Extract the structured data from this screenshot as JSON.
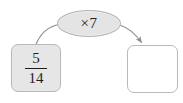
{
  "diagram": {
    "type": "function-machine",
    "operator": {
      "label": "×7",
      "operation": "multiply",
      "factor": "7"
    },
    "input_node": {
      "value": "5/14",
      "numerator": "5",
      "denominator": "14"
    },
    "output_node": {
      "value": "",
      "placeholder": ""
    },
    "connectors": [
      {
        "name": "input-to-operator",
        "from": "input_node",
        "to": "operator",
        "arrowhead": "none"
      },
      {
        "name": "operator-to-output",
        "from": "operator",
        "to": "output_node",
        "arrowhead": "end"
      }
    ]
  },
  "colors": {
    "background": "#ffffff",
    "node_fill": "#e6e6e6",
    "operator_fill": "#e4e4e4",
    "output_fill": "#ffffff",
    "border": "#b9b9b9",
    "text": "#1e1e1e",
    "connector": "#8d8d8d"
  }
}
